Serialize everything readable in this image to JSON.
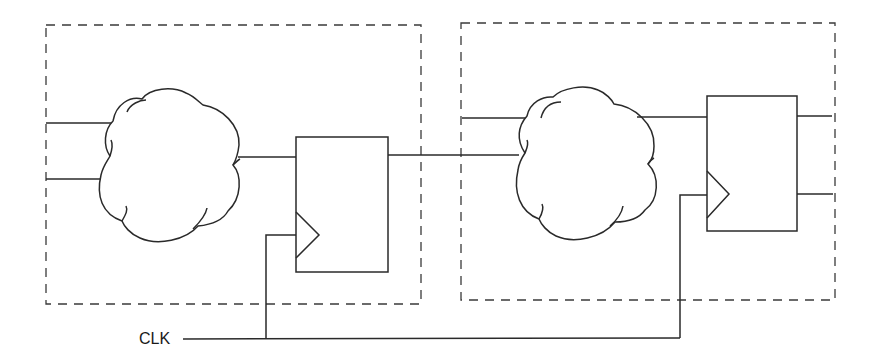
{
  "diagram": {
    "type": "synchronous-logic-pipeline",
    "stages": [
      {
        "name": "stage-1",
        "combinational_logic": "cloud",
        "inputs": 2,
        "register": "flip-flop",
        "register_outputs": 1
      },
      {
        "name": "stage-2",
        "combinational_logic": "cloud",
        "inputs": 2,
        "register": "flip-flop",
        "register_outputs": 2
      }
    ],
    "clock": {
      "label": "CLK",
      "drives": [
        "stage-1 flip-flop",
        "stage-2 flip-flop"
      ]
    },
    "colors": {
      "stroke": "#2a2a2a",
      "background": "#ffffff"
    }
  }
}
